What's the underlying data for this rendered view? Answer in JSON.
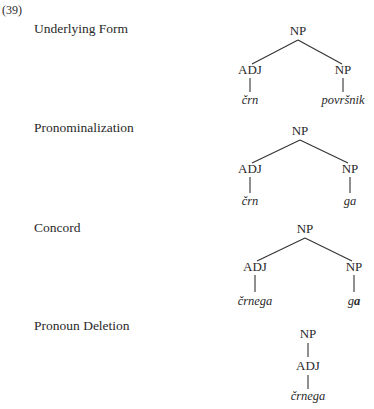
{
  "example_number": "(39)",
  "derivation": [
    {
      "step": "Underlying Form",
      "tree": {
        "root": "NP",
        "left": {
          "label": "ADJ",
          "word": "črn"
        },
        "right": {
          "label": "NP",
          "word": "površnik"
        }
      }
    },
    {
      "step": "Pronominalization",
      "tree": {
        "root": "NP",
        "left": {
          "label": "ADJ",
          "word": "črn"
        },
        "right": {
          "label": "NP",
          "word": "ga"
        }
      }
    },
    {
      "step": "Concord",
      "tree": {
        "root": "NP",
        "left": {
          "label": "ADJ",
          "word": "črnega"
        },
        "right": {
          "label": "NP",
          "word_prefix": "g",
          "word_bold": "a"
        }
      }
    },
    {
      "step": "Pronoun Deletion",
      "tree": {
        "root": "NP",
        "child": {
          "label": "ADJ",
          "word": "črnega"
        }
      }
    }
  ]
}
